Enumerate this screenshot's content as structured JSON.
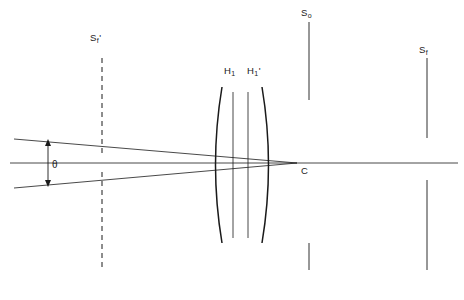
{
  "figure": {
    "type": "optical-ray-diagram",
    "background_color": "#ffffff",
    "line_color": "#1a1a1a"
  },
  "labels": {
    "front_focal_plane": {
      "base": "S",
      "sub": "f",
      "prime": "'",
      "x": 90,
      "y": 36
    },
    "object_plane": {
      "base": "S",
      "sub": "o",
      "prime": "",
      "x": 300,
      "y": 10
    },
    "back_focal_plane": {
      "base": "S",
      "sub": "f",
      "prime": "",
      "x": 419,
      "y": 48
    },
    "principal_plane_first": {
      "base": "H",
      "sub": "1",
      "prime": "",
      "x": 224,
      "y": 69
    },
    "principal_plane_second": {
      "base": "H",
      "sub": "1",
      "prime": "'",
      "x": 247,
      "y": 69
    },
    "angle_theta": {
      "text": "θ",
      "x": 52,
      "y": 166
    },
    "convergence_point": {
      "text": "C",
      "x": 301,
      "y": 168
    }
  },
  "geometry": {
    "optical_axis": {
      "x1": 10,
      "y1": 163,
      "x2": 458,
      "y2": 163
    },
    "ray_upper": {
      "x1": 14,
      "y1": 139,
      "x2": 296,
      "y2": 163
    },
    "ray_lower": {
      "x1": 14,
      "y1": 188,
      "x2": 296,
      "y2": 163
    },
    "angle_arrow": {
      "x": 48,
      "y_top": 141,
      "y_bottom": 185
    },
    "lens": {
      "left_surface_top": {
        "x": 222,
        "y": 87
      },
      "left_surface_bottom": {
        "x": 222,
        "y": 243
      },
      "left_surface_bulge_x": 212,
      "right_surface_top": {
        "x": 262,
        "y": 87
      },
      "right_surface_bottom": {
        "x": 262,
        "y": 243
      },
      "right_surface_bulge_x": 272,
      "principal_line_1_x": 233,
      "principal_line_2_x": 248,
      "principal_line_top": 92,
      "principal_line_bottom": 238
    },
    "plane_front_focal": {
      "x": 102,
      "top": 58,
      "bottom": 270,
      "style": "dashed",
      "gap_top": 157,
      "gap_bottom": 172
    },
    "plane_object": {
      "x": 309,
      "top": 22,
      "bottom": 270,
      "style": "solid",
      "gap_top": 100,
      "gap_bottom": 243
    },
    "plane_back_focal": {
      "x": 427,
      "top": 58,
      "bottom": 270,
      "style": "solid",
      "gap_top": 138,
      "gap_bottom": 180
    }
  }
}
